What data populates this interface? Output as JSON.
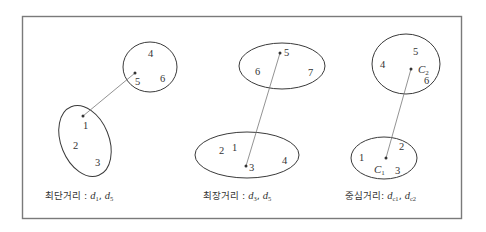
{
  "diagram": {
    "panels": [
      {
        "id": "shortest",
        "caption_label": "최단거리",
        "caption_sep": " : ",
        "caption_vars": [
          {
            "base": "d",
            "sub": "1"
          },
          {
            "base": "d",
            "sub": "5"
          }
        ],
        "caption_joiner": ", ",
        "cluster_a_points": [
          "4",
          "5",
          "6"
        ],
        "cluster_b_points": [
          "1",
          "2",
          "3"
        ],
        "link_from": "5",
        "link_to": "1"
      },
      {
        "id": "longest",
        "caption_label": "최장거리",
        "caption_sep": " : ",
        "caption_vars": [
          {
            "base": "d",
            "sub": "3"
          },
          {
            "base": "d",
            "sub": "5"
          }
        ],
        "caption_joiner": ", ",
        "cluster_a_points": [
          "5",
          "6",
          "7"
        ],
        "cluster_b_points": [
          "1",
          "2",
          "3",
          "4"
        ],
        "link_from": "5",
        "link_to": "3"
      },
      {
        "id": "centroid",
        "caption_label": "중심거리",
        "caption_sep": ": ",
        "caption_vars": [
          {
            "base": "d",
            "sub": "c1"
          },
          {
            "base": "d",
            "sub": "c2"
          }
        ],
        "caption_joiner": ", ",
        "cluster_a_points": [
          "4",
          "5",
          "6"
        ],
        "cluster_a_centroid": {
          "base": "C",
          "sub": "2"
        },
        "cluster_b_points": [
          "1",
          "2",
          "3"
        ],
        "cluster_b_centroid": {
          "base": "C",
          "sub": "1"
        },
        "link_from": "C2",
        "link_to": "C1"
      }
    ]
  }
}
